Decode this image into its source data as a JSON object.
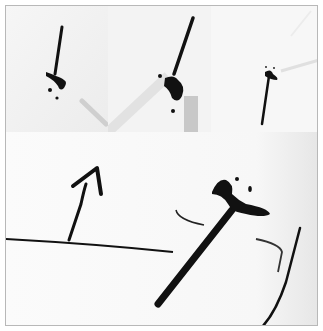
{
  "image": {
    "description": "Collage of black ink-like stick figures/splatters photographed on white surfaces; three small panels on top and one large panel below",
    "panels": [
      {
        "id": "top-left",
        "subject": "thin black stick with splattered blob at bottom"
      },
      {
        "id": "top-middle",
        "subject": "diagonal black stick with blob base, grey shadow"
      },
      {
        "id": "top-right",
        "subject": "short black stick with blob top and light diagonal streak"
      },
      {
        "id": "bottom",
        "subject": "large black stick with blob head, horizontal line, bent arrow-like stroke, curved thin strokes"
      }
    ],
    "colors": {
      "ink": "#111111",
      "paper": "#fafafa",
      "shadow": "#c8c8c8",
      "border": "#b8b8b8"
    }
  }
}
